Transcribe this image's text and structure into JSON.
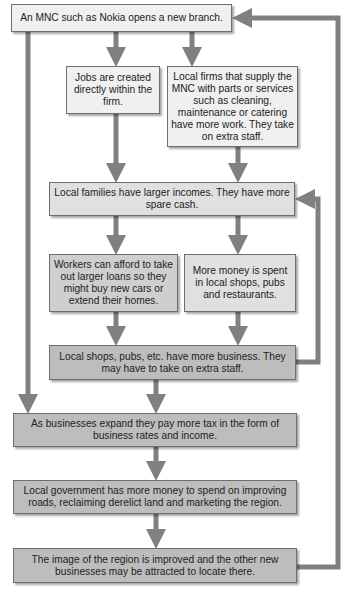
{
  "diagram": {
    "boxes": {
      "mnc": "An MNC such as Nokia opens a new branch.",
      "jobs": "Jobs are created directly within the firm.",
      "local_firms": "Local firms that supply the MNC with parts or services such as cleaning, maintenance or catering have more work. They take on extra staff.",
      "families": "Local families have larger incomes. They have more spare cash.",
      "workers": "Workers can afford to take out larger loans so they might buy new cars or extend their homes.",
      "more_money": "More money is spent in local shops, pubs and restaurants.",
      "shops": "Local shops, pubs, etc. have more business. They may have to take on extra staff.",
      "tax": "As businesses expand they pay more tax in the form of business rates and income.",
      "government": "Local government has more money to spend on improving roads, reclaiming derelict land and marketing the region.",
      "image": "The image of the region is improved and the other new businesses may be attracted to locate there."
    },
    "colors": {
      "arrow": "#808080",
      "box_border": "#6e6e6e",
      "box_light": "#f0f0f0",
      "box_mid": "#e0e0e0",
      "box_dark": "#bdbdbd"
    }
  }
}
